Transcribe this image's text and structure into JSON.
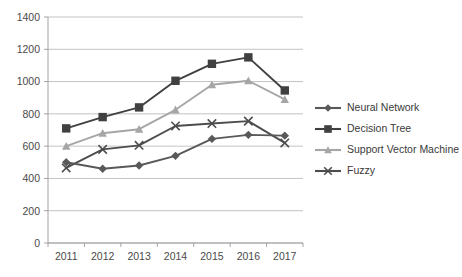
{
  "chart_data": {
    "type": "line",
    "title": "",
    "xlabel": "",
    "ylabel": "",
    "categories": [
      "2011",
      "2012",
      "2013",
      "2014",
      "2015",
      "2016",
      "2017"
    ],
    "ylim": [
      0,
      1400
    ],
    "yticks": [
      0,
      200,
      400,
      600,
      800,
      1000,
      1200,
      1400
    ],
    "grid": true,
    "legend_position": "right",
    "series": [
      {
        "name": "Neural Network",
        "marker": "diamond",
        "color": "#595959",
        "values": [
          500,
          460,
          480,
          540,
          645,
          670,
          665
        ]
      },
      {
        "name": "Decision Tree",
        "marker": "square",
        "color": "#404040",
        "values": [
          710,
          780,
          840,
          1005,
          1110,
          1150,
          945
        ]
      },
      {
        "name": "Support Vector Machine",
        "marker": "triangle",
        "color": "#a6a6a6",
        "values": [
          600,
          680,
          705,
          825,
          980,
          1005,
          890
        ]
      },
      {
        "name": "Fuzzy",
        "marker": "cross",
        "color": "#4d4d4d",
        "values": [
          465,
          580,
          605,
          725,
          740,
          755,
          620
        ]
      }
    ]
  },
  "legend": {
    "items": [
      {
        "label": "Neural Network"
      },
      {
        "label": "Decision Tree"
      },
      {
        "label": "Support Vector Machine"
      },
      {
        "label": "Fuzzy"
      }
    ]
  },
  "axes": {
    "y_tick_labels": [
      "1400",
      "1200",
      "1000",
      "800",
      "600",
      "400",
      "200",
      "0"
    ],
    "x_tick_labels": [
      "2011",
      "2012",
      "2013",
      "2014",
      "2015",
      "2016",
      "2017"
    ]
  },
  "colors": {
    "grid": "#b4b4b4",
    "axis": "#9a9a9a",
    "text": "#3a3a3a",
    "background": "#ffffff"
  }
}
